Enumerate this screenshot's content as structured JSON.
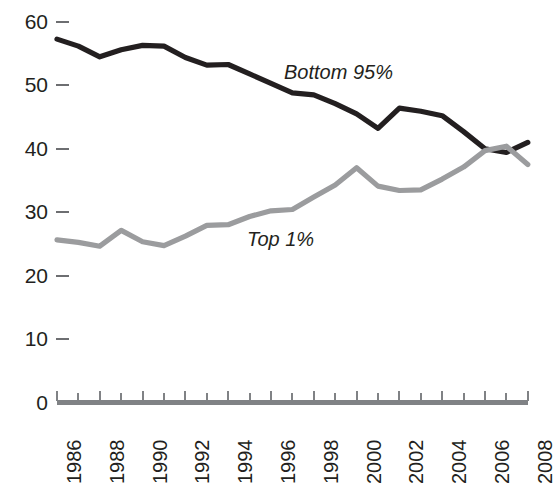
{
  "chart_data": {
    "type": "line",
    "title": "",
    "xlabel": "",
    "ylabel": "",
    "x": [
      1986,
      1987,
      1988,
      1989,
      1990,
      1991,
      1992,
      1993,
      1994,
      1995,
      1996,
      1997,
      1998,
      1999,
      2000,
      2001,
      2002,
      2003,
      2004,
      2005,
      2006,
      2007,
      2008
    ],
    "categories": [
      "1986",
      "1987",
      "1988",
      "1989",
      "1990",
      "1991",
      "1992",
      "1993",
      "1994",
      "1995",
      "1996",
      "1997",
      "1998",
      "1999",
      "2000",
      "2001",
      "2002",
      "2003",
      "2004",
      "2005",
      "2006",
      "2007",
      "2008"
    ],
    "xtick_labels": [
      "1986",
      "1988",
      "1990",
      "1992",
      "1994",
      "1996",
      "1998",
      "2000",
      "2002",
      "2004",
      "2006",
      "2008"
    ],
    "ytick_labels": [
      "0",
      "10",
      "20",
      "30",
      "40",
      "50",
      "60"
    ],
    "yticks": [
      0,
      10,
      20,
      30,
      40,
      50,
      60
    ],
    "ylim": [
      0,
      62
    ],
    "xlim": [
      1986,
      2008
    ],
    "grid": false,
    "legend_position": "inline-annotation",
    "series": [
      {
        "name": "Bottom 95%",
        "color": "#231f20",
        "label_x": 2000,
        "label_y": 51,
        "values": [
          57.3,
          56.2,
          54.5,
          55.6,
          56.3,
          56.2,
          54.4,
          53.2,
          53.3,
          51.8,
          50.3,
          48.8,
          48.5,
          47.1,
          45.5,
          43.2,
          46.4,
          45.9,
          45.2,
          42.7,
          40.0,
          39.4,
          41.0
        ]
      },
      {
        "name": "Top 1%",
        "color": "#9b9c9e",
        "label_x": 1997,
        "label_y": 26,
        "values": [
          25.6,
          25.2,
          24.6,
          27.1,
          25.3,
          24.7,
          26.2,
          27.9,
          28.0,
          29.3,
          30.2,
          30.4,
          32.4,
          34.3,
          37.0,
          34.1,
          33.4,
          33.5,
          35.2,
          37.1,
          39.7,
          40.4,
          37.5
        ]
      }
    ]
  },
  "axes": {
    "y_dash_color": "#6d6e71",
    "x_axis_color": "#808285"
  }
}
